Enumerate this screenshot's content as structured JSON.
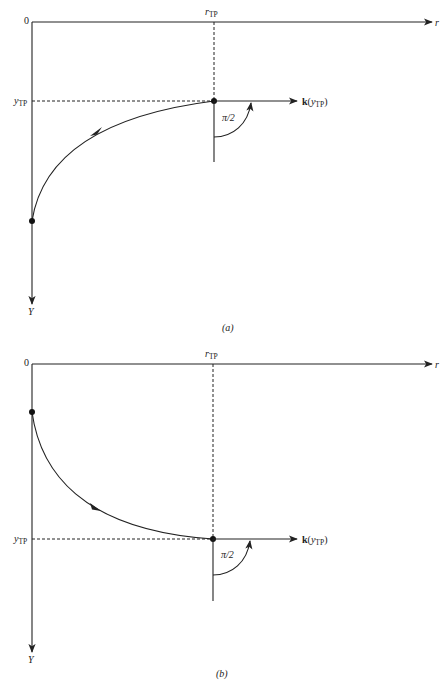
{
  "colors": {
    "ink": "#222222",
    "background": "#ffffff"
  },
  "panels": [
    {
      "id": "a",
      "caption": "(a)",
      "origin_label": "0",
      "x_axis_label": "r",
      "y_axis_label": "Y",
      "r_tp_label": "r",
      "r_tp_sub": "TP",
      "y_tp_label": "y",
      "y_tp_sub": "TP",
      "angle_label": "π/2",
      "k_label_bold": "k",
      "k_label_open": "(",
      "k_label_y": "y",
      "k_label_sub": "TP",
      "k_label_close": ")",
      "ray_direction": "upward (curve rises from start point to turning point)"
    },
    {
      "id": "b",
      "caption": "(b)",
      "origin_label": "0",
      "x_axis_label": "r",
      "y_axis_label": "Y",
      "r_tp_label": "r",
      "r_tp_sub": "TP",
      "y_tp_label": "y",
      "y_tp_sub": "TP",
      "angle_label": "π/2",
      "k_label_bold": "k",
      "k_label_open": "(",
      "k_label_y": "y",
      "k_label_sub": "TP",
      "k_label_close": ")",
      "ray_direction": "downward (curve descends from start point to turning point)"
    }
  ]
}
